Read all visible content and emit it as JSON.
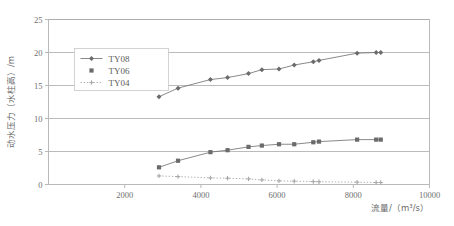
{
  "chart_data": {
    "type": "scatter",
    "title": "",
    "xlabel": "流量/（m³/s）",
    "ylabel": "动水压力（水柱高）/m",
    "xlim": [
      0,
      10000
    ],
    "ylim": [
      0,
      25
    ],
    "xticks": [
      2000,
      4000,
      6000,
      8000,
      10000
    ],
    "yticks": [
      0,
      5,
      10,
      15,
      20,
      25
    ],
    "xtick_labels": [
      "2000",
      "4000",
      "6000",
      "8000",
      "10000"
    ],
    "ytick_labels": [
      "0",
      "5",
      "10",
      "15",
      "20",
      "25"
    ],
    "grid": "horizontal",
    "legend_position": "upper-left-inside",
    "series": [
      {
        "name": "TY08",
        "marker": "diamond",
        "line": "solid",
        "color": "#6b6b6b",
        "points": [
          {
            "x": 2900,
            "y": 13.3
          },
          {
            "x": 3400,
            "y": 14.6
          },
          {
            "x": 4250,
            "y": 15.9
          },
          {
            "x": 4700,
            "y": 16.2
          },
          {
            "x": 5250,
            "y": 16.8
          },
          {
            "x": 5600,
            "y": 17.4
          },
          {
            "x": 6050,
            "y": 17.5
          },
          {
            "x": 6450,
            "y": 18.1
          },
          {
            "x": 6950,
            "y": 18.6
          },
          {
            "x": 7100,
            "y": 18.8
          },
          {
            "x": 8100,
            "y": 19.9
          },
          {
            "x": 8600,
            "y": 20.0
          },
          {
            "x": 8720,
            "y": 20.0
          }
        ]
      },
      {
        "name": "TY06",
        "marker": "square",
        "line": "solid",
        "color": "#6b6b6b",
        "points": [
          {
            "x": 2900,
            "y": 2.6
          },
          {
            "x": 3400,
            "y": 3.6
          },
          {
            "x": 4250,
            "y": 4.9
          },
          {
            "x": 4700,
            "y": 5.2
          },
          {
            "x": 5250,
            "y": 5.7
          },
          {
            "x": 5600,
            "y": 5.9
          },
          {
            "x": 6050,
            "y": 6.1
          },
          {
            "x": 6450,
            "y": 6.1
          },
          {
            "x": 6950,
            "y": 6.4
          },
          {
            "x": 7100,
            "y": 6.5
          },
          {
            "x": 8100,
            "y": 6.8
          },
          {
            "x": 8600,
            "y": 6.8
          },
          {
            "x": 8720,
            "y": 6.8
          }
        ]
      },
      {
        "name": "TY04",
        "marker": "cross",
        "line": "dotted",
        "color": "#a8a8a8",
        "points": [
          {
            "x": 2900,
            "y": 1.3
          },
          {
            "x": 3400,
            "y": 1.2
          },
          {
            "x": 4250,
            "y": 1.0
          },
          {
            "x": 4700,
            "y": 0.95
          },
          {
            "x": 5250,
            "y": 0.85
          },
          {
            "x": 5600,
            "y": 0.7
          },
          {
            "x": 6050,
            "y": 0.55
          },
          {
            "x": 6450,
            "y": 0.5
          },
          {
            "x": 6950,
            "y": 0.45
          },
          {
            "x": 7100,
            "y": 0.42
          },
          {
            "x": 8100,
            "y": 0.35
          },
          {
            "x": 8600,
            "y": 0.3
          },
          {
            "x": 8720,
            "y": 0.3
          }
        ]
      }
    ]
  },
  "legend": {
    "items": [
      {
        "label": "TY08"
      },
      {
        "label": "TY06"
      },
      {
        "label": "TY04"
      }
    ]
  },
  "axes": {
    "y_title": "动水压力（水柱高）/m",
    "x_title": "流量/（m³/s）"
  },
  "colors": {
    "axis": "#b9b9b9",
    "grid": "#a9a9a9",
    "series_dark": "#6b6b6b",
    "series_light": "#a8a8a8",
    "text": "#6a6a6a"
  }
}
